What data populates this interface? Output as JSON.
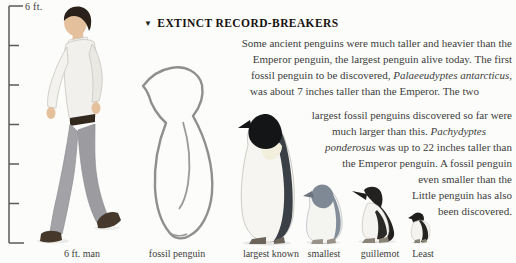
{
  "page": {
    "background": "#fcfcfa"
  },
  "scale_bar": {
    "top_label": "6 ft.",
    "tick_count": 7
  },
  "article": {
    "marker": "▼",
    "title": "EXTINCT RECORD-BREAKERS",
    "lines": [
      [
        {
          "t": "Some ancient penguins were much taller and heavier than the"
        }
      ],
      [
        {
          "t": "Emperor penguin, the largest penguin alive today. The first"
        }
      ],
      [
        {
          "t": "fossil penguin to be discovered, "
        },
        {
          "t": "Palaeeudyptes antarcticus",
          "i": true
        },
        {
          "t": ","
        }
      ],
      [
        {
          "t": "was about 7 inches taller than the Emperor. The two"
        }
      ],
      [
        {
          "t": "largest fossil penguins discovered so far were"
        }
      ],
      [
        {
          "t": "much larger than this. "
        },
        {
          "t": "Pachydyptes",
          "i": true
        }
      ],
      [
        {
          "t": "ponderosus",
          "i": true
        },
        {
          "t": " was up to 22 inches taller than"
        }
      ],
      [
        {
          "t": "the Emperor penguin. A fossil penguin"
        }
      ],
      [
        {
          "t": "even smaller than the"
        }
      ],
      [
        {
          "t": "Little penguin has also"
        }
      ],
      [
        {
          "t": "been discovered."
        }
      ]
    ]
  },
  "figure_labels": {
    "man": "6 ft. man",
    "fossil": "fossil penguin",
    "largest": "largest known",
    "smallest": "smallest",
    "guillemot": "guillemot",
    "least": "Least"
  },
  "colors": {
    "text": "#3d3d3d",
    "title_ink": "#15120f",
    "ruler": "#5a5a5a",
    "fossil_outline": "#8f8f8d",
    "penguin_dark": "#3a4046",
    "penguin_black": "#141517",
    "little_penguin_gray": "#848e9b"
  }
}
